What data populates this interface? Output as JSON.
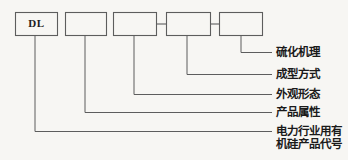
{
  "figure": {
    "kind": "product-code-designation-diagram",
    "boxes": [
      {
        "id": "box-dl",
        "text": "DL"
      },
      {
        "id": "box-2",
        "text": ""
      },
      {
        "id": "box-3",
        "text": ""
      },
      {
        "id": "box-4",
        "text": ""
      },
      {
        "id": "box-5",
        "text": ""
      }
    ],
    "separators": [
      "-",
      "-"
    ],
    "callouts": [
      {
        "id": "callout-vulcanization-mechanism",
        "text": "硫化机理",
        "source_box": "box-5"
      },
      {
        "id": "callout-forming-method",
        "text": "成型方式",
        "source_box": "box-4"
      },
      {
        "id": "callout-appearance-form",
        "text": "外观形态",
        "source_box": "box-3"
      },
      {
        "id": "callout-product-attribute",
        "text": "产品属性",
        "source_box": "box-2"
      },
      {
        "id": "callout-power-industry-silicone-code",
        "line1": "电力行业用有",
        "line2": "机硅产品代号",
        "source_box": "box-dl"
      }
    ],
    "colors": {
      "background": "#f7f6f3",
      "stroke": "#5d5d5d",
      "text": "#1a1a1a"
    }
  }
}
